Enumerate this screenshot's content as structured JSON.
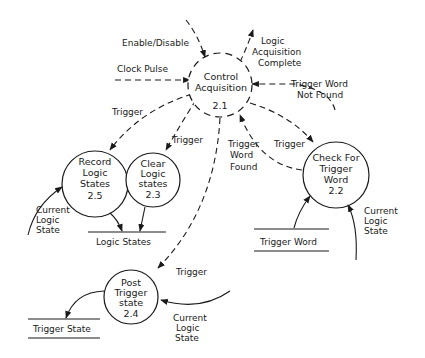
{
  "diagram": {
    "type": "data-flow-diagram",
    "processes": [
      {
        "id": "2.1",
        "lines": [
          "Control",
          "Acquisition"
        ],
        "number": "2.1",
        "control": true
      },
      {
        "id": "2.2",
        "lines": [
          "Check For",
          "Trigger",
          "Word"
        ],
        "number": "2.2"
      },
      {
        "id": "2.3",
        "lines": [
          "Clear",
          "Logic",
          "states"
        ],
        "number": "2.3"
      },
      {
        "id": "2.4",
        "lines": [
          "Post",
          "Trigger",
          "state"
        ],
        "number": "2.4"
      },
      {
        "id": "2.5",
        "lines": [
          "Record",
          "Logic",
          "States"
        ],
        "number": "2.5"
      }
    ],
    "stores": [
      {
        "id": "logic-states",
        "label": "Logic States"
      },
      {
        "id": "trigger-word",
        "label": "Trigger Word"
      },
      {
        "id": "trigger-state",
        "label": "Trigger State"
      }
    ],
    "flows": {
      "enable_disable": "Enable/Disable",
      "clock_pulse": "Clock Pulse",
      "logic_acq_complete": [
        "Logic",
        "Acquisition",
        "Complete"
      ],
      "trigger_word_not_found": [
        "Trigger Word",
        "Not Found"
      ],
      "trigger_to_record": "Trigger",
      "trigger_to_clear": "Trigger",
      "trigger_word_found": [
        "Trigger",
        "Word",
        "Found"
      ],
      "trigger_to_check": "Trigger",
      "trigger_to_post": "Trigger",
      "current_logic_state_record": [
        "Current",
        "Logic",
        "State"
      ],
      "current_logic_state_check": [
        "Current",
        "Logic",
        "State"
      ],
      "current_logic_state_post": [
        "Current",
        "Logic",
        "State"
      ]
    }
  }
}
